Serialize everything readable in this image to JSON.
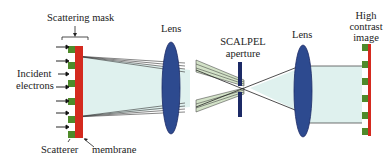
{
  "labels": {
    "scattering_mask": "Scattering mask",
    "incident_line1": "Incident",
    "incident_line2": "electrons",
    "scatterer": "Scatterer",
    "membrane": "membrane",
    "lens_left": "Lens",
    "aperture_line1": "SCALPEL",
    "aperture_line2": "aperture",
    "lens_right": "Lens",
    "image_line1": "High",
    "image_line2": "contrast",
    "image_line3": "image"
  },
  "colors": {
    "membrane": "#d42a1f",
    "scatterer": "#4e8a2a",
    "lens": "#2d4a8f",
    "aperture": "#1c2a66",
    "beam_fill": "#dff1ee",
    "scattered_fill": "#d3e2c8",
    "line": "#333333"
  }
}
